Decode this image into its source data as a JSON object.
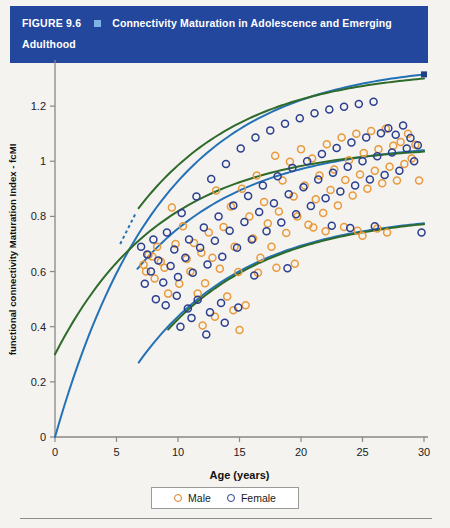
{
  "header": {
    "figure_number": "FIGURE 9.6",
    "bullet_icon": "square-bullet-icon",
    "title": "Connectivity Maturation in Adolescence and Emerging Adulthood",
    "bar_color": "#23479c",
    "bullet_color": "#7fb2e5",
    "text_color": "#ffffff"
  },
  "legend": {
    "items": [
      {
        "label": "Male",
        "color": "#e07b22",
        "marker": "open-circle"
      },
      {
        "label": "Female",
        "color": "#2a3f8f",
        "marker": "open-circle"
      }
    ]
  },
  "chart_data": {
    "type": "scatter",
    "title": "Connectivity Maturation in Adolescence and Emerging Adulthood",
    "xlabel": "Age (years)",
    "ylabel": "functional connectivity Maturation Index - fcMI",
    "xlim": [
      0,
      30
    ],
    "ylim": [
      0,
      1.36
    ],
    "xticks": [
      0,
      5,
      10,
      15,
      20,
      25,
      30
    ],
    "xticklabels": [
      "0",
      "5",
      "10",
      "15",
      "20",
      "25",
      "30"
    ],
    "yticks": [
      0,
      0.2,
      0.4,
      0.6,
      0.8,
      1.0,
      1.2
    ],
    "yticklabels": [
      "0",
      "0.2",
      "0.4",
      "0.6",
      "0.8",
      "1",
      "1.2"
    ],
    "grid": false,
    "legend_position": "bottom-center",
    "series": [
      {
        "name": "Male",
        "color": "#e89a3c",
        "marker": "open-circle",
        "points": [
          [
            7.2,
            0.625
          ],
          [
            7.4,
            0.6
          ],
          [
            7.6,
            0.66
          ],
          [
            7.9,
            0.655
          ],
          [
            8.1,
            0.575
          ],
          [
            8.3,
            0.69
          ],
          [
            8.6,
            0.636
          ],
          [
            8.9,
            0.614
          ],
          [
            9.2,
            0.52
          ],
          [
            9.5,
            0.832
          ],
          [
            9.8,
            0.7
          ],
          [
            10.1,
            0.556
          ],
          [
            10.4,
            0.764
          ],
          [
            10.7,
            0.646
          ],
          [
            11.0,
            0.6
          ],
          [
            11.3,
            0.704
          ],
          [
            11.6,
            0.52
          ],
          [
            11.9,
            0.668
          ],
          [
            12.2,
            0.558
          ],
          [
            12.5,
            0.742
          ],
          [
            12.8,
            0.65
          ],
          [
            13.1,
            0.894
          ],
          [
            13.4,
            0.61
          ],
          [
            13.7,
            0.762
          ],
          [
            14.0,
            0.51
          ],
          [
            14.3,
            0.836
          ],
          [
            14.6,
            0.69
          ],
          [
            14.9,
            0.598
          ],
          [
            15.2,
            0.9
          ],
          [
            15.5,
            0.478
          ],
          [
            15.8,
            0.8
          ],
          [
            16.1,
            0.72
          ],
          [
            16.4,
            0.948
          ],
          [
            16.7,
            0.65
          ],
          [
            17.0,
            0.852
          ],
          [
            17.3,
            0.774
          ],
          [
            17.6,
            0.69
          ],
          [
            17.9,
            1.02
          ],
          [
            18.2,
            0.818
          ],
          [
            18.5,
            0.93
          ],
          [
            18.8,
            0.74
          ],
          [
            19.1,
            0.998
          ],
          [
            19.4,
            0.872
          ],
          [
            19.7,
            0.8
          ],
          [
            20.0,
            1.044
          ],
          [
            20.3,
            0.912
          ],
          [
            20.6,
            0.77
          ],
          [
            20.9,
            1.01
          ],
          [
            21.2,
            0.862
          ],
          [
            21.5,
            0.948
          ],
          [
            21.8,
            0.812
          ],
          [
            22.1,
            1.062
          ],
          [
            22.4,
            0.896
          ],
          [
            22.7,
            0.97
          ],
          [
            23.0,
            0.84
          ],
          [
            23.3,
            1.086
          ],
          [
            23.6,
            0.932
          ],
          [
            23.9,
            1.004
          ],
          [
            24.2,
            0.876
          ],
          [
            24.5,
            1.1
          ],
          [
            24.8,
            0.952
          ],
          [
            25.1,
            1.03
          ],
          [
            25.4,
            0.9
          ],
          [
            25.7,
            1.11
          ],
          [
            26.0,
            0.966
          ],
          [
            26.3,
            1.044
          ],
          [
            26.6,
            0.92
          ],
          [
            26.9,
            1.118
          ],
          [
            27.2,
            0.98
          ],
          [
            27.5,
            1.056
          ],
          [
            27.8,
            0.93
          ],
          [
            28.1,
            1.07
          ],
          [
            28.4,
            0.99
          ],
          [
            28.7,
            1.1
          ],
          [
            29.0,
            1.01
          ],
          [
            29.3,
            1.06
          ],
          [
            29.6,
            0.93
          ],
          [
            21.0,
            0.76
          ],
          [
            22.0,
            0.746
          ],
          [
            23.5,
            0.762
          ],
          [
            24.6,
            0.748
          ],
          [
            26.2,
            0.756
          ],
          [
            25.0,
            0.73
          ],
          [
            27.0,
            0.742
          ],
          [
            18.0,
            0.614
          ],
          [
            19.5,
            0.628
          ],
          [
            16.5,
            0.596
          ],
          [
            12.0,
            0.404
          ],
          [
            13.0,
            0.436
          ],
          [
            14.5,
            0.46
          ],
          [
            15.0,
            0.388
          ]
        ]
      },
      {
        "name": "Female",
        "color": "#2a3f8f",
        "marker": "open-circle",
        "points": [
          [
            7.5,
            0.662
          ],
          [
            7.8,
            0.6
          ],
          [
            8.0,
            0.716
          ],
          [
            8.4,
            0.64
          ],
          [
            8.8,
            0.56
          ],
          [
            9.1,
            0.742
          ],
          [
            9.4,
            0.62
          ],
          [
            9.7,
            0.68
          ],
          [
            10.0,
            0.58
          ],
          [
            10.3,
            0.812
          ],
          [
            10.6,
            0.65
          ],
          [
            10.9,
            0.716
          ],
          [
            11.2,
            0.596
          ],
          [
            11.5,
            0.872
          ],
          [
            11.8,
            0.686
          ],
          [
            12.1,
            0.76
          ],
          [
            12.4,
            0.626
          ],
          [
            12.7,
            0.936
          ],
          [
            13.0,
            0.712
          ],
          [
            13.3,
            0.8
          ],
          [
            13.6,
            0.654
          ],
          [
            13.9,
            0.99
          ],
          [
            14.2,
            0.748
          ],
          [
            14.5,
            0.84
          ],
          [
            14.8,
            0.686
          ],
          [
            15.1,
            1.046
          ],
          [
            15.4,
            0.78
          ],
          [
            15.7,
            0.874
          ],
          [
            16.0,
            0.716
          ],
          [
            16.3,
            1.086
          ],
          [
            16.6,
            0.816
          ],
          [
            16.9,
            0.912
          ],
          [
            17.2,
            0.746
          ],
          [
            17.5,
            1.112
          ],
          [
            17.8,
            0.848
          ],
          [
            18.1,
            0.946
          ],
          [
            18.4,
            0.778
          ],
          [
            18.7,
            1.136
          ],
          [
            19.0,
            0.88
          ],
          [
            19.3,
            0.976
          ],
          [
            19.6,
            0.808
          ],
          [
            19.9,
            1.156
          ],
          [
            20.2,
            0.906
          ],
          [
            20.5,
            1.0
          ],
          [
            20.8,
            0.838
          ],
          [
            21.1,
            1.174
          ],
          [
            21.4,
            0.934
          ],
          [
            21.7,
            1.026
          ],
          [
            22.0,
            0.866
          ],
          [
            22.3,
            1.188
          ],
          [
            22.6,
            0.958
          ],
          [
            22.9,
            1.048
          ],
          [
            23.2,
            0.89
          ],
          [
            23.5,
            1.198
          ],
          [
            23.8,
            0.98
          ],
          [
            24.1,
            1.068
          ],
          [
            24.4,
            0.912
          ],
          [
            24.7,
            1.208
          ],
          [
            25.0,
            1.0
          ],
          [
            25.3,
            1.086
          ],
          [
            25.6,
            0.934
          ],
          [
            25.9,
            1.216
          ],
          [
            26.2,
            1.018
          ],
          [
            26.5,
            1.102
          ],
          [
            26.8,
            0.95
          ],
          [
            27.1,
            1.12
          ],
          [
            27.4,
            1.032
          ],
          [
            27.7,
            1.096
          ],
          [
            28.0,
            0.966
          ],
          [
            28.3,
            1.13
          ],
          [
            28.6,
            1.046
          ],
          [
            28.9,
            1.084
          ],
          [
            29.2,
            1.0
          ],
          [
            29.5,
            1.058
          ],
          [
            8.2,
            0.5
          ],
          [
            9.0,
            0.478
          ],
          [
            9.9,
            0.512
          ],
          [
            10.8,
            0.466
          ],
          [
            11.6,
            0.498
          ],
          [
            12.6,
            0.452
          ],
          [
            13.5,
            0.486
          ],
          [
            14.9,
            0.47
          ],
          [
            10.2,
            0.4
          ],
          [
            11.1,
            0.432
          ],
          [
            12.3,
            0.372
          ],
          [
            13.8,
            0.414
          ],
          [
            22.5,
            0.766
          ],
          [
            24.0,
            0.758
          ],
          [
            26.0,
            0.764
          ],
          [
            29.8,
            0.742
          ],
          [
            7.0,
            0.69
          ],
          [
            7.3,
            0.556
          ],
          [
            16.2,
            0.586
          ],
          [
            18.9,
            0.612
          ]
        ]
      }
    ],
    "fit_curves": [
      {
        "name": "upper-fit-blue",
        "color": "#2472b5",
        "from": [
          0.0,
          0.0
        ],
        "to": [
          30.0,
          1.315
        ]
      },
      {
        "name": "upper-fit-green",
        "color": "#2e6b2a",
        "from": [
          6.8,
          0.83
        ],
        "to": [
          30.0,
          1.3
        ]
      },
      {
        "name": "middle-fit-blue",
        "color": "#2472b5",
        "from": [
          6.7,
          0.61
        ],
        "to": [
          30.0,
          1.04
        ]
      },
      {
        "name": "middle-fit-green",
        "color": "#2e6b2a",
        "from": [
          0.0,
          0.3
        ],
        "to": [
          30.0,
          1.035
        ]
      },
      {
        "name": "lower-fit-blue",
        "color": "#2472b5",
        "from": [
          6.8,
          0.27
        ],
        "to": [
          30.0,
          0.775
        ]
      },
      {
        "name": "lower-fit-green",
        "color": "#2e6b2a",
        "from": [
          9.2,
          0.39
        ],
        "to": [
          30.0,
          0.772
        ]
      }
    ],
    "endpoint_marker": {
      "name": "square-endpoint",
      "color": "#1f3f87",
      "x": 30.0,
      "y": 1.315
    }
  }
}
